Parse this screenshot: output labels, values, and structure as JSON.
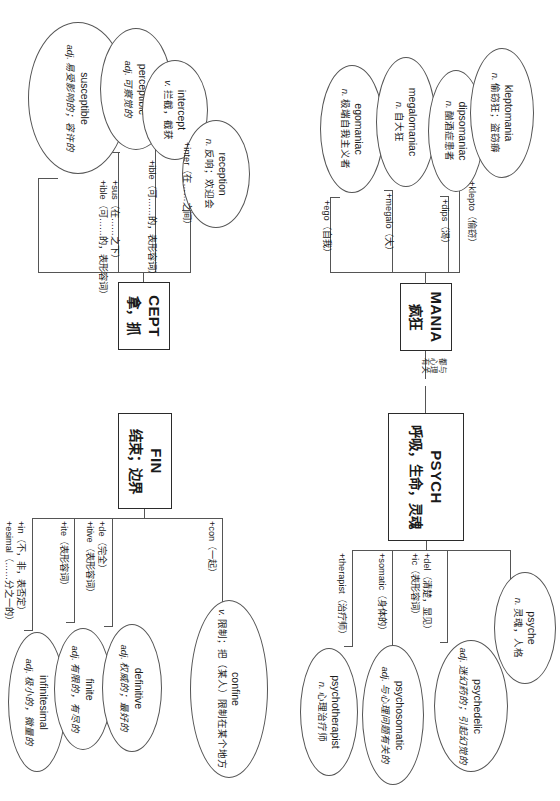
{
  "meta": {
    "orientation": "rotated-90",
    "ink_color": "#555555",
    "text_color": "#1a1a1a",
    "background": "#ffffff"
  },
  "center_note": {
    "name": "psych-mania-link-note",
    "lines": [
      "都与",
      "心理",
      "有关"
    ],
    "text": "都与心理有关"
  },
  "roots": [
    {
      "id": "cept",
      "root": "CEPT",
      "gloss": "拿，抓",
      "branches": [
        {
          "affix": "+sus（在……之下）",
          "affix2": "+ible（可……的，表形容词）",
          "affix_lines": [
            "+sus（在……之下）",
            "+ible（可……的，",
            "表形容词）"
          ],
          "word": "susceptible",
          "pos": "adj.",
          "def": "易受影响的；容许的"
        },
        {
          "affix": "+ible（可……的，表形容词）",
          "affix2": "",
          "affix_lines": [
            "+ible（可……的，表形容词）"
          ],
          "word": "perceptible",
          "pos": "adj.",
          "def": "可察觉的"
        },
        {
          "affix": "+inter（在……之间）",
          "affix2": "",
          "affix_lines": [
            "+inter（在……之间）"
          ],
          "word": "intercept",
          "pos": "v.",
          "def": "拦截，截获"
        },
        {
          "affix": "",
          "affix2": "",
          "affix_lines": [],
          "word": "reception",
          "pos": "n.",
          "def": "反响；欢迎会"
        }
      ]
    },
    {
      "id": "mania",
      "root": "MANIA",
      "gloss": "疯狂",
      "branches": [
        {
          "affix": "+ego（自我）",
          "affix_lines": [
            "+ego（自我）"
          ],
          "word": "egomaniac",
          "pos": "n.",
          "def": "极端自我主义者"
        },
        {
          "affix": "+megalo（大）",
          "affix_lines": [
            "+megalo（大）"
          ],
          "word": "megalomaniac",
          "pos": "n.",
          "def": "自大狂"
        },
        {
          "affix": "+dips（渴）",
          "affix_lines": [
            "+dips（渴）"
          ],
          "word": "dipsomaniac",
          "pos": "n.",
          "def": "酗酒症患者"
        },
        {
          "affix": "+klepto（偷窃）",
          "affix_lines": [
            "+klepto（偷窃）"
          ],
          "word": "kleptomania",
          "pos": "n.",
          "def": "偷窃狂；盗窃癖"
        }
      ]
    },
    {
      "id": "fin",
      "root": "FIN",
      "gloss": "结束；边界",
      "branches": [
        {
          "affix": "+in（不，非，表否定）",
          "affix2": "+esimal（……分之一的）",
          "affix_lines": [
            "+in（不，非，表否定）",
            "+esimal（……分之一的）"
          ],
          "word": "infinitesimal",
          "pos": "adj.",
          "def": "极小的，微量的"
        },
        {
          "affix": "+ite（表形容词）",
          "affix2": "",
          "affix_lines": [
            "+ite（表形容词）"
          ],
          "word": "finite",
          "pos": "adj.",
          "def": "有限的，有尽的"
        },
        {
          "affix": "+de（完全）",
          "affix2": "+itive（表形容词）",
          "affix_lines": [
            "+de（完全）",
            "+itive（表形容词）"
          ],
          "word": "definitive",
          "pos": "adj.",
          "def": "权威的；最好的"
        },
        {
          "affix": "+con（一起）",
          "affix2": "",
          "affix_lines": [
            "+con（一起）"
          ],
          "word": "confine",
          "pos": "v.",
          "def": "限制；把（某人）限制在某个地方"
        }
      ]
    },
    {
      "id": "psych",
      "root": "PSYCH",
      "gloss": "呼吸，生命，灵魂",
      "branches": [
        {
          "affix": "+therapist（治疗师）",
          "affix_lines": [
            "+therapist（治疗师）"
          ],
          "word": "psychotherapist",
          "pos": "n.",
          "def": "心理治疗师"
        },
        {
          "affix": "+somatic（身体的）",
          "affix_lines": [
            "+somatic（身体的）"
          ],
          "word": "psychosomatic",
          "pos": "adj.",
          "def": "与心理问题有关的"
        },
        {
          "affix": "+del（清楚，显见）",
          "affix2": "+ic（表形容词）",
          "affix_lines": [
            "+del（清楚，显见）",
            "+ic（表形容词）"
          ],
          "word": "psychedelic",
          "pos": "adj.",
          "def": "迷幻药的；引起幻觉的"
        },
        {
          "affix": "",
          "affix_lines": [],
          "word": "psyche",
          "pos": "n.",
          "def": "灵魂，人格"
        }
      ]
    }
  ]
}
